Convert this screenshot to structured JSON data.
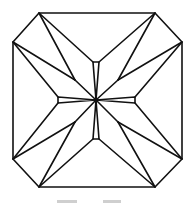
{
  "diagram": {
    "stroke": "#111111",
    "background": "#ffffff",
    "stroke_width": 1.6,
    "center": [
      96,
      100
    ],
    "center_dot_radius": 2.3,
    "outline": [
      [
        39,
        13
      ],
      [
        155,
        13
      ],
      [
        182,
        42
      ],
      [
        182,
        159
      ],
      [
        155,
        187
      ],
      [
        39,
        187
      ],
      [
        13,
        159
      ],
      [
        13,
        42
      ]
    ],
    "center_facets": [
      {
        "name": "top-facet",
        "points": [
          [
            93,
            62
          ],
          [
            99,
            62
          ],
          [
            96,
            100
          ]
        ]
      },
      {
        "name": "bottom-facet",
        "points": [
          [
            93,
            139
          ],
          [
            99,
            139
          ],
          [
            96,
            100
          ]
        ]
      },
      {
        "name": "left-facet",
        "points": [
          [
            58,
            97
          ],
          [
            58,
            103
          ],
          [
            96,
            100
          ]
        ]
      },
      {
        "name": "right-facet",
        "points": [
          [
            135,
            97
          ],
          [
            135,
            103
          ],
          [
            96,
            100
          ]
        ]
      }
    ],
    "star_points": [
      [
        75,
        80
      ],
      [
        118,
        80
      ],
      [
        75,
        122
      ],
      [
        118,
        122
      ]
    ],
    "lines": [
      [
        [
          39,
          13
        ],
        [
          93,
          62
        ]
      ],
      [
        [
          39,
          13
        ],
        [
          75,
          80
        ]
      ],
      [
        [
          13,
          42
        ],
        [
          75,
          80
        ]
      ],
      [
        [
          13,
          42
        ],
        [
          58,
          97
        ]
      ],
      [
        [
          75,
          80
        ],
        [
          96,
          100
        ]
      ],
      [
        [
          155,
          13
        ],
        [
          99,
          62
        ]
      ],
      [
        [
          155,
          13
        ],
        [
          118,
          80
        ]
      ],
      [
        [
          182,
          42
        ],
        [
          118,
          80
        ]
      ],
      [
        [
          182,
          42
        ],
        [
          135,
          97
        ]
      ],
      [
        [
          118,
          80
        ],
        [
          96,
          100
        ]
      ],
      [
        [
          13,
          159
        ],
        [
          58,
          103
        ]
      ],
      [
        [
          13,
          159
        ],
        [
          75,
          122
        ]
      ],
      [
        [
          39,
          187
        ],
        [
          75,
          122
        ]
      ],
      [
        [
          39,
          187
        ],
        [
          93,
          139
        ]
      ],
      [
        [
          75,
          122
        ],
        [
          96,
          100
        ]
      ],
      [
        [
          182,
          159
        ],
        [
          135,
          103
        ]
      ],
      [
        [
          182,
          159
        ],
        [
          118,
          122
        ]
      ],
      [
        [
          155,
          187
        ],
        [
          118,
          122
        ]
      ],
      [
        [
          155,
          187
        ],
        [
          99,
          139
        ]
      ],
      [
        [
          118,
          122
        ],
        [
          96,
          100
        ]
      ]
    ]
  },
  "caption": {
    "clipped": true,
    "visible_fragments": [
      [
        57,
        20
      ],
      [
        103,
        18
      ]
    ]
  }
}
